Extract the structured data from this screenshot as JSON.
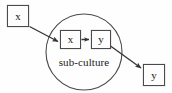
{
  "diagram": {
    "type": "node-link-diagram",
    "background_color": "#fefefe",
    "stroke_color": "#4a4a4a",
    "text_color": "#1a1a1a",
    "canvas": {
      "width": 172,
      "height": 93
    },
    "cluster": {
      "shape": "circle",
      "label": "sub-culture",
      "center_x": 84,
      "center_y": 52,
      "radius": 38
    },
    "nodes": [
      {
        "id": "x-outer",
        "label": "x",
        "x": 7,
        "y": 5,
        "width": 22,
        "height": 22,
        "inside_cluster": false
      },
      {
        "id": "x-inner",
        "label": "x",
        "x": 60,
        "y": 30,
        "width": 21,
        "height": 19,
        "inside_cluster": true
      },
      {
        "id": "y-inner",
        "label": "y",
        "x": 91,
        "y": 30,
        "width": 20,
        "height": 19,
        "inside_cluster": true
      },
      {
        "id": "y-outer",
        "label": "y",
        "x": 143,
        "y": 64,
        "width": 22,
        "height": 22,
        "inside_cluster": false
      }
    ],
    "edges": [
      {
        "id": "edge-x-outer-to-x-inner",
        "from": "x-outer",
        "to": "x-inner",
        "style": "solid",
        "arrowhead": true
      },
      {
        "id": "edge-x-inner-to-y-inner",
        "from": "x-inner",
        "to": "y-inner",
        "style": "solid",
        "arrowhead": true
      },
      {
        "id": "edge-y-inner-to-y-outer",
        "from": "y-inner",
        "to": "y-outer",
        "style": "solid",
        "arrowhead": true
      }
    ]
  }
}
